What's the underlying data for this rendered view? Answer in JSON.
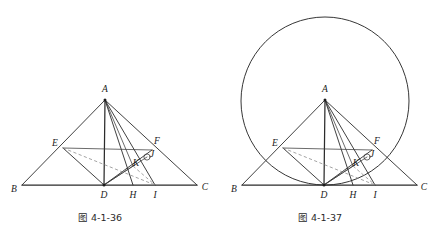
{
  "page": {
    "background_color": "#ffffff",
    "width": 429,
    "height": 239,
    "line_color": "#2b2b2b",
    "dashed_color": "#8d8d8d"
  },
  "figures": [
    {
      "id": "figure-left",
      "caption": "图 4-1-36",
      "caption_pos": {
        "x": 100,
        "y": 218
      },
      "has_circle": false,
      "points": {
        "A": {
          "x": 105,
          "y": 100,
          "label": "A",
          "label_x": 105,
          "label_y": 90
        },
        "B": {
          "x": 22,
          "y": 185,
          "label": "B",
          "label_x": 14,
          "label_y": 190
        },
        "C": {
          "x": 197,
          "y": 185,
          "label": "C",
          "label_x": 205,
          "label_y": 188
        },
        "D": {
          "x": 104,
          "y": 185,
          "label": "D",
          "label_x": 104,
          "label_y": 196
        },
        "E": {
          "x": 63,
          "y": 148,
          "label": "E",
          "label_x": 55,
          "label_y": 144
        },
        "F": {
          "x": 152,
          "y": 150,
          "label": "F",
          "label_x": 157,
          "label_y": 142
        },
        "H": {
          "x": 133,
          "y": 185,
          "label": "H",
          "label_x": 133,
          "label_y": 196
        },
        "I": {
          "x": 155,
          "y": 185,
          "label": "I",
          "label_x": 155,
          "label_y": 196
        },
        "J": {
          "x": 147,
          "y": 157,
          "label": "J",
          "label_x": 152,
          "label_y": 155
        },
        "K": {
          "x": 133,
          "y": 166,
          "label": "K",
          "label_x": 136,
          "label_y": 164
        }
      }
    },
    {
      "id": "figure-right",
      "caption": "图 4-1-37",
      "caption_pos": {
        "x": 320,
        "y": 218
      },
      "has_circle": true,
      "circle": {
        "cx": 325,
        "cy": 101,
        "r": 84
      },
      "points": {
        "A": {
          "x": 325,
          "y": 100,
          "label": "A",
          "label_x": 325,
          "label_y": 90
        },
        "B": {
          "x": 242,
          "y": 185,
          "label": "B",
          "label_x": 234,
          "label_y": 190
        },
        "C": {
          "x": 417,
          "y": 185,
          "label": "C",
          "label_x": 424,
          "label_y": 188
        },
        "D": {
          "x": 324,
          "y": 185,
          "label": "D",
          "label_x": 324,
          "label_y": 196
        },
        "E": {
          "x": 283,
          "y": 148,
          "label": "E",
          "label_x": 275,
          "label_y": 144
        },
        "F": {
          "x": 372,
          "y": 150,
          "label": "F",
          "label_x": 377,
          "label_y": 142
        },
        "H": {
          "x": 353,
          "y": 185,
          "label": "H",
          "label_x": 353,
          "label_y": 196
        },
        "I": {
          "x": 375,
          "y": 185,
          "label": "I",
          "label_x": 375,
          "label_y": 196
        },
        "J": {
          "x": 367,
          "y": 157,
          "label": "J",
          "label_x": 372,
          "label_y": 155
        },
        "K": {
          "x": 353,
          "y": 166,
          "label": "K",
          "label_x": 356,
          "label_y": 164
        }
      }
    }
  ]
}
